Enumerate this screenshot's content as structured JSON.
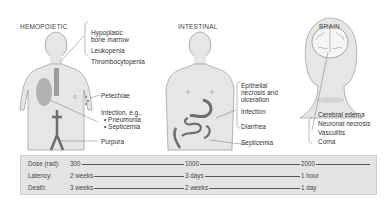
{
  "sections": [
    {
      "heading": "HEMOPOIETIC",
      "labels": [
        "Hypoplasic",
        "bone marrow",
        "Leukopenia",
        "Thrombocytopenia",
        "Petechiae",
        "Infection, e.g.,",
        "• Pneumonia",
        "• Septicemia",
        "Purpura"
      ]
    },
    {
      "heading": "INTESTINAL",
      "labels": [
        "Epithelial",
        "necrosis and",
        "ulceration",
        "Infection",
        "Diarrhea",
        "Septicemia"
      ]
    },
    {
      "heading": "BRAIN",
      "labels": [
        "Cerebral edema",
        "Neuronal necrosis",
        "Vasculitis",
        "Coma"
      ]
    }
  ],
  "table": {
    "rows": [
      {
        "key": "Dose (rad):",
        "values": [
          "300",
          "1000",
          "2000"
        ]
      },
      {
        "key": "Latency:",
        "values": [
          "2 weeks",
          "3 days",
          "1 hour"
        ]
      },
      {
        "key": "Death:",
        "values": [
          "3 weeks",
          "2 weeks",
          "1 day"
        ]
      }
    ]
  },
  "colors": {
    "skin": "#e6e6e6",
    "outline": "#8a8a8a",
    "organ": "#6e6e6e",
    "table_bg": "#e4e4e4"
  }
}
